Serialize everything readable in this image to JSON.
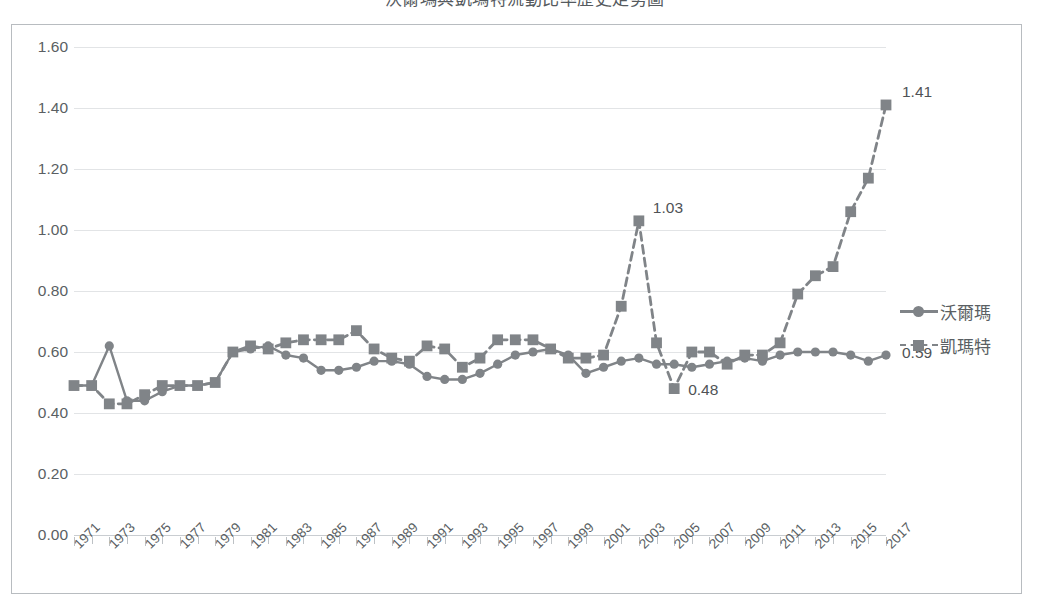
{
  "chart_title": "沃爾瑪與凱瑪特流動比率歷史走勢圖",
  "legend": {
    "position": "right",
    "items": [
      {
        "label": "沃爾瑪",
        "style": "solid",
        "marker": "circle",
        "color": "#808488"
      },
      {
        "label": "凱瑪特",
        "style": "dashed",
        "marker": "square",
        "color": "#808488"
      }
    ]
  },
  "axis": {
    "y_ticks": [
      "0.00",
      "0.20",
      "0.40",
      "0.60",
      "0.80",
      "1.00",
      "1.20",
      "1.40",
      "1.60"
    ],
    "x_tick_labels": [
      "1971",
      "1973",
      "1975",
      "1977",
      "1979",
      "1981",
      "1983",
      "1985",
      "1987",
      "1989",
      "1991",
      "1993",
      "1995",
      "1997",
      "1999",
      "2001",
      "2003",
      "2005",
      "2007",
      "2009",
      "2011",
      "2013",
      "2015",
      "2017"
    ]
  },
  "annotations": [
    {
      "text": "1.03",
      "series": "凱瑪特",
      "x": 2003,
      "y": 1.03
    },
    {
      "text": "0.48",
      "series": "凱瑪特",
      "x": 2005,
      "y": 0.48
    },
    {
      "text": "1.41",
      "series": "凱瑪特",
      "x": 2017,
      "y": 1.41
    },
    {
      "text": "0.59",
      "series": "沃爾瑪",
      "x": 2017,
      "y": 0.59
    }
  ],
  "chart_data": {
    "type": "line",
    "title": "沃爾瑪與凱瑪特流動比率歷史走勢圖",
    "xlabel": "",
    "ylabel": "",
    "ylim": [
      0.0,
      1.6
    ],
    "ytick_step": 0.2,
    "grid": true,
    "legend_position": "right",
    "x": [
      1971,
      1972,
      1973,
      1974,
      1975,
      1976,
      1977,
      1978,
      1979,
      1980,
      1981,
      1982,
      1983,
      1984,
      1985,
      1986,
      1987,
      1988,
      1989,
      1990,
      1991,
      1992,
      1993,
      1994,
      1995,
      1996,
      1997,
      1998,
      1999,
      2000,
      2001,
      2002,
      2003,
      2004,
      2005,
      2006,
      2007,
      2008,
      2009,
      2010,
      2011,
      2012,
      2013,
      2014,
      2015,
      2016,
      2017
    ],
    "series": [
      {
        "name": "沃爾瑪",
        "style": "solid",
        "marker": "circle",
        "color": "#808488",
        "values": [
          0.49,
          0.49,
          0.62,
          0.44,
          0.44,
          0.47,
          0.49,
          0.49,
          0.5,
          0.6,
          0.61,
          0.62,
          0.59,
          0.58,
          0.54,
          0.54,
          0.55,
          0.57,
          0.57,
          0.56,
          0.52,
          0.51,
          0.51,
          0.53,
          0.56,
          0.59,
          0.6,
          0.61,
          0.59,
          0.53,
          0.55,
          0.57,
          0.58,
          0.56,
          0.56,
          0.55,
          0.56,
          0.57,
          0.58,
          0.57,
          0.59,
          0.6,
          0.6,
          0.6,
          0.59,
          0.57,
          0.59
        ]
      },
      {
        "name": "凱瑪特",
        "style": "dashed",
        "marker": "square",
        "color": "#808488",
        "values": [
          0.49,
          0.49,
          0.43,
          0.43,
          0.46,
          0.49,
          0.49,
          0.49,
          0.5,
          0.6,
          0.62,
          0.61,
          0.63,
          0.64,
          0.64,
          0.64,
          0.67,
          0.61,
          0.58,
          0.57,
          0.62,
          0.61,
          0.55,
          0.58,
          0.64,
          0.64,
          0.64,
          0.61,
          0.58,
          0.58,
          0.59,
          0.75,
          1.03,
          0.63,
          0.48,
          0.6,
          0.6,
          0.56,
          0.59,
          0.59,
          0.63,
          0.79,
          0.85,
          0.88,
          1.06,
          1.17,
          1.41
        ]
      }
    ]
  }
}
